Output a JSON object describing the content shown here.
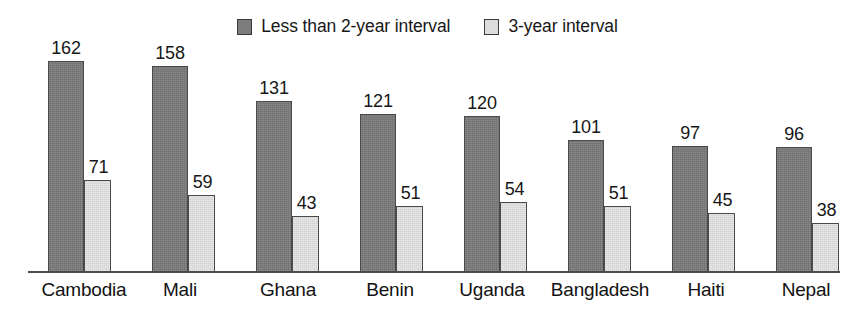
{
  "legend": {
    "entries": [
      {
        "label": "Less than 2-year interval",
        "swatch": "dark-gray-square-icon",
        "color": "#7c7c7c"
      },
      {
        "label": "3-year interval",
        "swatch": "light-gray-square-icon",
        "color": "#dcdcdc"
      }
    ]
  },
  "chart_data": {
    "type": "bar",
    "title": "",
    "subtitle": "",
    "xlabel": "",
    "ylabel": "",
    "grid": false,
    "legend_position": "top-center",
    "ylim": [
      0,
      162
    ],
    "categories": [
      "Cambodia",
      "Mali",
      "Ghana",
      "Benin",
      "Uganda",
      "Bangladesh",
      "Haiti",
      "Nepal"
    ],
    "series": [
      {
        "name": "Less than 2-year interval",
        "color": "#7c7c7c",
        "values": [
          162,
          158,
          131,
          121,
          120,
          101,
          97,
          96
        ]
      },
      {
        "name": "3-year interval",
        "color": "#dcdcdc",
        "values": [
          71,
          59,
          43,
          51,
          54,
          51,
          45,
          38
        ]
      }
    ]
  },
  "axis": {
    "baseline_color": "#4d4d4d"
  }
}
